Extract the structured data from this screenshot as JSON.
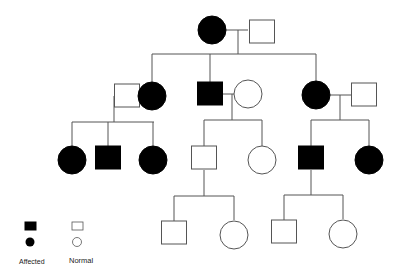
{
  "diagram": {
    "type": "pedigree",
    "colors": {
      "affected": "#000000",
      "normal_fill": "#ffffff",
      "line": "#555555"
    },
    "generations": [
      {
        "id": "I",
        "individuals": [
          {
            "id": "I-1",
            "sex": "female",
            "affected": true,
            "cx": 212,
            "cy": 30
          },
          {
            "id": "I-2",
            "sex": "male",
            "affected": false,
            "cx": 262,
            "cy": 32
          }
        ]
      },
      {
        "id": "II",
        "individuals": [
          {
            "id": "II-1",
            "sex": "male",
            "affected": false,
            "cx": 127,
            "cy": 96
          },
          {
            "id": "II-2",
            "sex": "female",
            "affected": true,
            "cx": 152,
            "cy": 96
          },
          {
            "id": "II-3",
            "sex": "male",
            "affected": true,
            "cx": 210,
            "cy": 94
          },
          {
            "id": "II-4",
            "sex": "female",
            "affected": false,
            "cx": 248,
            "cy": 94
          },
          {
            "id": "II-5",
            "sex": "female",
            "affected": true,
            "cx": 316,
            "cy": 95
          },
          {
            "id": "II-6",
            "sex": "male",
            "affected": false,
            "cx": 364,
            "cy": 95
          }
        ]
      },
      {
        "id": "III",
        "individuals": [
          {
            "id": "III-1",
            "sex": "female",
            "affected": true,
            "cx": 72,
            "cy": 160
          },
          {
            "id": "III-2",
            "sex": "male",
            "affected": true,
            "cx": 108,
            "cy": 158
          },
          {
            "id": "III-3",
            "sex": "female",
            "affected": true,
            "cx": 153,
            "cy": 160
          },
          {
            "id": "III-4",
            "sex": "male",
            "affected": false,
            "cx": 204,
            "cy": 158
          },
          {
            "id": "III-5",
            "sex": "female",
            "affected": false,
            "cx": 262,
            "cy": 160
          },
          {
            "id": "III-6",
            "sex": "male",
            "affected": true,
            "cx": 311,
            "cy": 158
          },
          {
            "id": "III-7",
            "sex": "female",
            "affected": true,
            "cx": 369,
            "cy": 160
          }
        ]
      },
      {
        "id": "IV",
        "individuals": [
          {
            "id": "IV-1",
            "sex": "male",
            "affected": false,
            "cx": 174,
            "cy": 233
          },
          {
            "id": "IV-2",
            "sex": "female",
            "affected": false,
            "cx": 234,
            "cy": 235
          },
          {
            "id": "IV-3",
            "sex": "male",
            "affected": false,
            "cx": 284,
            "cy": 232
          },
          {
            "id": "IV-4",
            "sex": "female",
            "affected": false,
            "cx": 343,
            "cy": 234
          }
        ]
      }
    ],
    "legend": {
      "affected_label": "Affected",
      "normal_label": "Normal"
    }
  }
}
